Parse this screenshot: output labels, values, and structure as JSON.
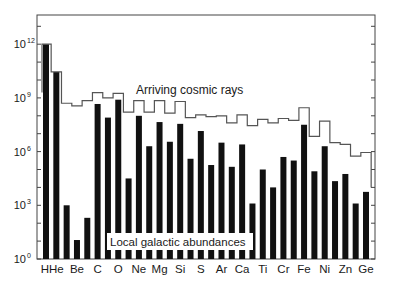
{
  "chart_data": {
    "type": "bar",
    "title": "",
    "xlabel": "",
    "ylabel": "",
    "yscale": "log",
    "ylim": [
      1,
      10000000000000.0
    ],
    "y_ticks": [
      {
        "exp": 0,
        "label": "10",
        "sup": "0"
      },
      {
        "exp": 3,
        "label": "10",
        "sup": "3"
      },
      {
        "exp": 6,
        "label": "10",
        "sup": "6"
      },
      {
        "exp": 9,
        "label": "10",
        "sup": "9"
      },
      {
        "exp": 12,
        "label": "10",
        "sup": "12"
      }
    ],
    "categories": [
      "H",
      "He",
      "Li",
      "Be",
      "B",
      "C",
      "N",
      "O",
      "F",
      "Ne",
      "Na",
      "Mg",
      "Al",
      "Si",
      "P",
      "S",
      "Cl",
      "Ar",
      "K",
      "Ca",
      "Sc",
      "Ti",
      "V",
      "Cr",
      "Mn",
      "Fe",
      "Co",
      "Ni",
      "Cu",
      "Zn",
      "Ga",
      "Ge"
    ],
    "x_tick_labels": [
      "H",
      "He",
      "Be",
      "C",
      "O",
      "Ne",
      "Mg",
      "Si",
      "S",
      "Ar",
      "Ca",
      "Ti",
      "Cr",
      "Fe",
      "Ni",
      "Zn",
      "Ge"
    ],
    "series": [
      {
        "name": "Local galactic abundances",
        "style": "black bars",
        "log10_values": [
          12.0,
          10.45,
          3.0,
          1.06,
          2.3,
          8.66,
          7.9,
          8.9,
          4.5,
          8.0,
          6.3,
          7.65,
          6.55,
          7.55,
          5.6,
          7.15,
          5.25,
          6.5,
          5.15,
          6.4,
          3.1,
          5.0,
          4.0,
          5.7,
          5.5,
          7.5,
          4.9,
          6.3,
          4.35,
          4.75,
          3.1,
          3.75
        ]
      },
      {
        "name": "Arriving cosmic rays",
        "style": "step line",
        "log10_values": [
          12.0,
          10.45,
          8.7,
          8.55,
          8.85,
          9.3,
          9.0,
          9.25,
          8.2,
          8.85,
          8.2,
          8.85,
          8.15,
          8.8,
          7.9,
          8.05,
          7.95,
          8.0,
          7.6,
          8.05,
          7.45,
          7.8,
          7.6,
          7.85,
          7.75,
          8.45,
          6.85,
          7.7,
          6.5,
          6.4,
          5.75,
          5.95
        ]
      }
    ],
    "annotations": [
      {
        "text": "Arriving cosmic rays",
        "near": "step line above Ne–Si"
      },
      {
        "text": "Local galactic abundances",
        "near": "boxed label over bars O–Ca at bottom"
      }
    ],
    "grid": false,
    "legend": "inline annotations"
  },
  "labels": {
    "cosmic": "Arriving cosmic rays",
    "local": "Local galactic abundances"
  },
  "colors": {
    "bars": "#111111",
    "step_line": "#555555",
    "axis": "#444444"
  }
}
